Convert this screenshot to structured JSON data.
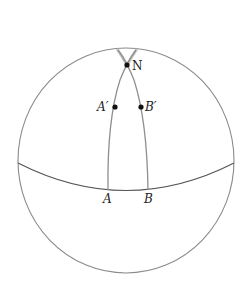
{
  "diagram": {
    "type": "sphere-geodesics",
    "colors": {
      "outline": "#8a8a8a",
      "meridian": "#8f8f8f",
      "meridian_cap": "#c8c8c8",
      "point": "#111111",
      "label": "#222222"
    },
    "points": [
      {
        "id": "N",
        "label": "N",
        "x": 127,
        "y": 65
      },
      {
        "id": "A_prime",
        "label": "A′",
        "x": 115,
        "y": 107
      },
      {
        "id": "B_prime",
        "label": "B′",
        "x": 141,
        "y": 107
      }
    ],
    "labels": {
      "N": "N",
      "A_prime": "A′",
      "B_prime": "B′",
      "A": "A",
      "B": "B"
    }
  }
}
